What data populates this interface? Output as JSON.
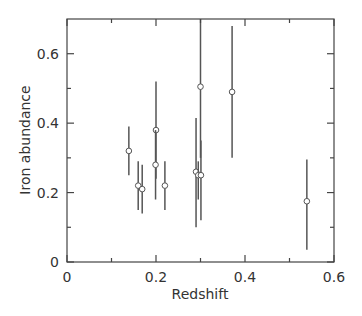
{
  "chart_data": {
    "type": "scatter",
    "title": "",
    "xlabel": "Redshift",
    "ylabel": "Iron abundance",
    "xlim": [
      0,
      0.6
    ],
    "ylim": [
      0,
      0.7
    ],
    "xticks": [
      0,
      0.2,
      0.4,
      0.6
    ],
    "xtick_labels": [
      "0",
      "0.2",
      "0.4",
      "0.6"
    ],
    "xminor_ticks": [
      0.1,
      0.3,
      0.5
    ],
    "yticks": [
      0,
      0.2,
      0.4,
      0.6
    ],
    "ytick_labels": [
      "0",
      "0.2",
      "0.4",
      "0.6"
    ],
    "yminor_ticks": [
      0.1,
      0.3,
      0.5
    ],
    "grid": false,
    "legend": null,
    "marker": "open-circle",
    "series": [
      {
        "name": "clusters",
        "points": [
          {
            "x": 0.139,
            "y": 0.32,
            "y_low": 0.25,
            "y_high": 0.39
          },
          {
            "x": 0.16,
            "y": 0.22,
            "y_low": 0.15,
            "y_high": 0.29
          },
          {
            "x": 0.169,
            "y": 0.21,
            "y_low": 0.14,
            "y_high": 0.28
          },
          {
            "x": 0.2,
            "y": 0.38,
            "y_low": 0.24,
            "y_high": 0.52
          },
          {
            "x": 0.199,
            "y": 0.28,
            "y_low": 0.18,
            "y_high": 0.38
          },
          {
            "x": 0.22,
            "y": 0.22,
            "y_low": 0.15,
            "y_high": 0.29
          },
          {
            "x": 0.29,
            "y": 0.26,
            "y_low": 0.1,
            "y_high": 0.415
          },
          {
            "x": 0.295,
            "y": 0.25,
            "y_low": 0.18,
            "y_high": 0.29
          },
          {
            "x": 0.301,
            "y": 0.25,
            "y_low": 0.12,
            "y_high": 0.35
          },
          {
            "x": 0.3,
            "y": 0.505,
            "y_low": 0.3,
            "y_high": 0.7
          },
          {
            "x": 0.371,
            "y": 0.49,
            "y_low": 0.3,
            "y_high": 0.68
          },
          {
            "x": 0.539,
            "y": 0.175,
            "y_low": 0.035,
            "y_high": 0.295
          }
        ]
      }
    ]
  }
}
